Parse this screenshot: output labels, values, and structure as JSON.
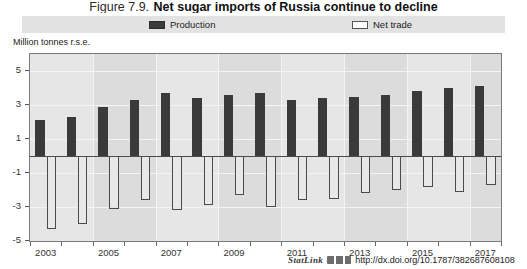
{
  "figure": {
    "number": "Figure 7.9.",
    "title": "Net sugar imports of Russia continue to decline",
    "unit_label": "Million tonnes r.s.e."
  },
  "legend": {
    "items": [
      {
        "label": "Production",
        "swatch": "filled-dark-square-icon",
        "color": "#3b3b3b"
      },
      {
        "label": "Net trade",
        "swatch": "open-white-square-icon",
        "color": "#ffffff"
      }
    ]
  },
  "statlink": {
    "word": "StatLink",
    "glyph": "barcode-icon",
    "url": "http://dx.doi.org/10.1787/382687608108"
  },
  "chart_data": {
    "type": "bar",
    "title": "Net sugar imports of Russia continue to decline",
    "subtitle": "",
    "xlabel": "",
    "ylabel": "Million tonnes r.s.e.",
    "ylim": [
      -5,
      6
    ],
    "yticks": [
      5,
      3,
      1,
      -1,
      -3,
      -5
    ],
    "ytick_labels": [
      "5",
      "3",
      "1",
      "-1",
      "-3",
      "-5"
    ],
    "grid": true,
    "legend_position": "top",
    "x": [
      2003,
      2004,
      2005,
      2006,
      2007,
      2008,
      2009,
      2010,
      2011,
      2012,
      2013,
      2014,
      2015,
      2016,
      2017
    ],
    "categories": [
      "2003",
      "2004",
      "2005",
      "2006",
      "2007",
      "2008",
      "2009",
      "2010",
      "2011",
      "2012",
      "2013",
      "2014",
      "2015",
      "2016",
      "2017"
    ],
    "xtick_labels": [
      "2003",
      "2005",
      "2007",
      "2009",
      "2011",
      "2013",
      "2015",
      "2017"
    ],
    "xticks": [
      2003,
      2005,
      2007,
      2009,
      2011,
      2013,
      2015,
      2017
    ],
    "series": [
      {
        "name": "Production",
        "color": "#3b3b3b",
        "values": [
          2.1,
          2.3,
          2.9,
          3.3,
          3.7,
          3.4,
          3.6,
          3.7,
          3.3,
          3.4,
          3.5,
          3.6,
          3.8,
          4.0,
          4.1
        ]
      },
      {
        "name": "Net trade",
        "color": "#ffffff",
        "values": [
          -4.3,
          -4.0,
          -3.1,
          -2.6,
          -3.2,
          -2.9,
          -2.3,
          -3.0,
          -2.6,
          -2.5,
          -2.2,
          -2.0,
          -1.8,
          -2.1,
          -1.7
        ]
      }
    ]
  }
}
